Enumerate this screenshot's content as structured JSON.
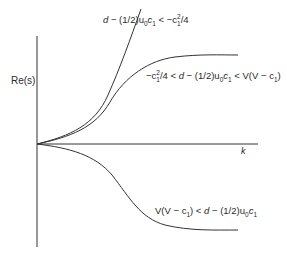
{
  "diagram": {
    "title": "",
    "axes": {
      "y_label": "Re(s)",
      "x_label": "k"
    },
    "curves": [
      {
        "id": "steep",
        "label": "d − (1/2)u₀c₁ < −c₁²/4",
        "label_parts": {
          "a": "d",
          "b": " − (1/2)u",
          "b_sub": "0",
          "c": "c",
          "c_sub": "1",
          "d": " < −c",
          "d_sup": "2",
          "d_sub": "1",
          "e": "/4"
        },
        "behavior": "grows without bound"
      },
      {
        "id": "saturating-positive",
        "label": "−c₁²/4 < d − (1/2)u₀c₁ < V(V − c₁)",
        "label_parts": {
          "a": "−c",
          "a_sup": "2",
          "a_sub": "1",
          "b": "/4 < ",
          "c": "d",
          "d": " − (1/2)u",
          "d_sub": "0",
          "e": "c",
          "e_sub": "1",
          "f": " < V(V − c",
          "f_sub": "1",
          "g": ")"
        },
        "behavior": "rises then saturates to positive plateau"
      },
      {
        "id": "saturating-negative",
        "label": "V(V − c₁) < d − (1/2)u₀c₁",
        "label_parts": {
          "a": "V(V − c",
          "a_sub": "1",
          "b": ") < ",
          "c": "d",
          "d": " − (1/2)u",
          "d_sub": "0",
          "e": "c",
          "e_sub": "1"
        },
        "behavior": "decreases then saturates to negative plateau"
      }
    ],
    "colors": {
      "line": "#333333",
      "text": "#2a2a2a",
      "background": "#ffffff"
    }
  }
}
